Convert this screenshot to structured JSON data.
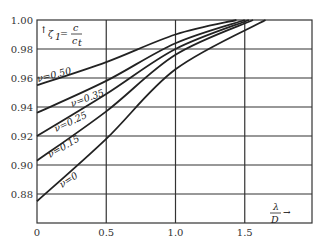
{
  "chart_data": {
    "type": "line",
    "title": "",
    "ylabel": "ζ1 = c / c_t",
    "xlabel": "λ / D",
    "xlim": [
      0,
      1.75
    ],
    "ylim": [
      0.86,
      1.0
    ],
    "x_ticks": [
      "0",
      "0.5",
      "1.0",
      "1.5"
    ],
    "y_ticks": [
      "0.88",
      "0.90",
      "0.92",
      "0.94",
      "0.96",
      "0.98",
      "1.00"
    ],
    "grid": true,
    "series": [
      {
        "name": "ν=0.50",
        "x": [
          0,
          0.5,
          1.0,
          1.44
        ],
        "y": [
          0.955,
          0.971,
          0.99,
          1.0
        ]
      },
      {
        "name": "ν=0.35",
        "x": [
          0,
          0.5,
          1.0,
          1.5
        ],
        "y": [
          0.936,
          0.958,
          0.984,
          1.0
        ]
      },
      {
        "name": "ν=0.25",
        "x": [
          0,
          0.5,
          1.0,
          1.53
        ],
        "y": [
          0.92,
          0.949,
          0.98,
          1.0
        ]
      },
      {
        "name": "ν=0.15",
        "x": [
          0,
          0.5,
          1.0,
          1.56
        ],
        "y": [
          0.903,
          0.937,
          0.976,
          1.0
        ]
      },
      {
        "name": "ν=0",
        "x": [
          0,
          0.5,
          1.0,
          1.65
        ],
        "y": [
          0.875,
          0.918,
          0.966,
          1.0
        ]
      }
    ]
  },
  "labels": {
    "y_axis_symbol": "ζ",
    "y_axis_sub": "1",
    "y_axis_eq": "=",
    "y_num": "c",
    "y_den": "c",
    "y_den_sub": "t",
    "x_num": "λ",
    "x_den": "D",
    "curve_labels": [
      "ν=0.50",
      "ν=0.35",
      "ν=0.25",
      "ν=0.15",
      "ν=0"
    ]
  }
}
